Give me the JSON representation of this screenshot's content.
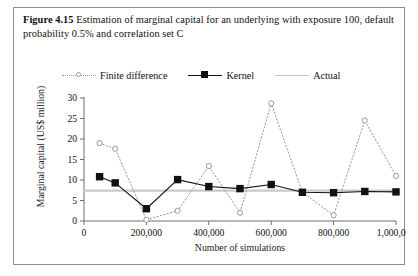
{
  "caption": {
    "figure_label": "Figure 4.15",
    "text": "Estimation of marginal capital for an underlying with exposure 100, default probability 0.5% and correlation set C"
  },
  "legend": {
    "position": "top-center",
    "items": [
      {
        "label": "Finite difference",
        "marker": "open-circle",
        "line": "dotted",
        "color": "#9a9a9a"
      },
      {
        "label": "Kernel",
        "marker": "filled-square",
        "line": "solid",
        "color": "#111111"
      },
      {
        "label": "Actual",
        "marker": "none",
        "line": "solid",
        "color": "#c9c9c9"
      }
    ]
  },
  "axes": {
    "x": {
      "title": "Number of simulations",
      "ticks": [
        "0",
        "200,000",
        "400,000",
        "600,000",
        "800,000",
        "1,000,000"
      ],
      "tick_values": [
        0,
        200000,
        400000,
        600000,
        800000,
        1000000
      ],
      "min": 0,
      "max": 1000000
    },
    "y": {
      "title": "Marginal capital (US$ million)",
      "ticks": [
        "0",
        "5",
        "10",
        "15",
        "20",
        "25",
        "30"
      ],
      "tick_values": [
        0,
        5,
        10,
        15,
        20,
        25,
        30
      ],
      "min": 0,
      "max": 30
    }
  },
  "chart_data": {
    "type": "line",
    "title": "Estimation of marginal capital for an underlying with exposure 100, default probability 0.5% and correlation set C",
    "xlabel": "Number of simulations",
    "ylabel": "Marginal capital (US$ million)",
    "xlim": [
      0,
      1000000
    ],
    "ylim": [
      0,
      30
    ],
    "grid": false,
    "legend_position": "top-center",
    "x": [
      50000,
      100000,
      200000,
      300000,
      400000,
      500000,
      600000,
      700000,
      800000,
      900000,
      1000000
    ],
    "series": [
      {
        "name": "Finite difference",
        "style": "dotted",
        "marker": "open-circle",
        "color": "#9a9a9a",
        "values": [
          19.0,
          17.6,
          0.3,
          2.5,
          13.4,
          2.0,
          28.7,
          7.0,
          1.4,
          24.5,
          11.0
        ]
      },
      {
        "name": "Kernel",
        "style": "solid",
        "marker": "filled-square",
        "color": "#111111",
        "values": [
          10.8,
          9.3,
          3.0,
          10.1,
          8.4,
          7.9,
          8.9,
          7.0,
          6.9,
          7.2,
          7.1
        ]
      },
      {
        "name": "Actual",
        "style": "solid",
        "marker": "none",
        "color": "#c9c9c9",
        "constant": 7.4,
        "values": [
          7.4,
          7.4,
          7.4,
          7.4,
          7.4,
          7.4,
          7.4,
          7.4,
          7.4,
          7.4,
          7.4
        ]
      }
    ]
  }
}
